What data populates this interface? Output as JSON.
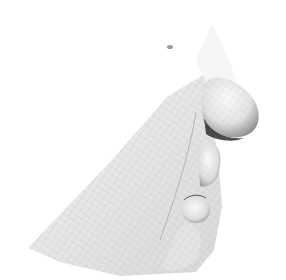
{
  "image": {
    "subject": "3D wireframe mesh render of lower face profile (nose, lips, chin)",
    "background_color": "#ffffff",
    "mesh_color": "#9a9a9a",
    "shadow_color": "#3a3a3a"
  }
}
